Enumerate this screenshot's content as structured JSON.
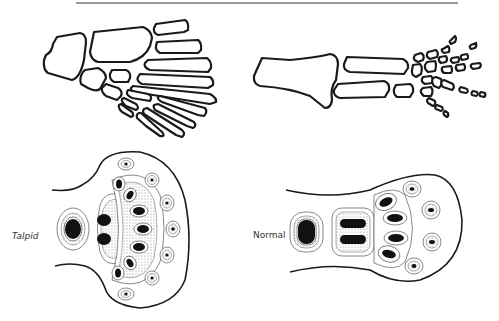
{
  "figure": {
    "top_rule": true,
    "panels": [
      {
        "id": "talpid-skeleton",
        "position": "top-left",
        "description": "Talpid limb skeleton: broad fan of carpals/metacarpals"
      },
      {
        "id": "normal-skeleton",
        "position": "top-right",
        "description": "Normal limb skeleton: radius/ulna, carpals, five digits with phalanges"
      },
      {
        "id": "talpid-bud",
        "position": "bottom-left",
        "description": "Talpid limb bud condensations, broad fan-shaped"
      },
      {
        "id": "normal-bud",
        "position": "bottom-right",
        "description": "Normal limb bud condensations, narrow paddle"
      }
    ],
    "labels": {
      "talpid": "Talpid",
      "normal": "Normal"
    }
  },
  "colors": {
    "ink": "#1a1a1a",
    "background": "#ffffff",
    "stipple": "#9a9a9a"
  }
}
